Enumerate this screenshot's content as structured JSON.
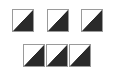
{
  "diagram": {
    "colors": {
      "light": "#ffffff",
      "dark": "#2a2a2a",
      "border": "#9a9a9a"
    },
    "rows": [
      {
        "tiles": [
          {
            "x": 12,
            "y": 9
          },
          {
            "x": 47,
            "y": 9
          },
          {
            "x": 81,
            "y": 9
          }
        ]
      },
      {
        "tiles": [
          {
            "x": 23,
            "y": 44
          },
          {
            "x": 46,
            "y": 44
          },
          {
            "x": 69,
            "y": 44
          }
        ]
      }
    ]
  }
}
